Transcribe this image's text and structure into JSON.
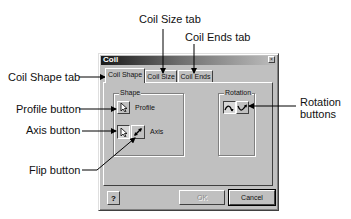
{
  "dialog": {
    "title": "Coil",
    "close_glyph": "×",
    "tabs": [
      {
        "label": "Coil Shape",
        "active": true
      },
      {
        "label": "Coil Size",
        "active": false
      },
      {
        "label": "Coil Ends",
        "active": false
      }
    ],
    "shape_group": {
      "label": "Shape",
      "profile_label": "Profile",
      "axis_label": "Axis",
      "profile_icon": "cursor-arrow-icon",
      "axis_icon": "cursor-arrow-icon",
      "flip_icon": "flip-diagonal-arrow-icon"
    },
    "rotation_group": {
      "label": "Rotation",
      "buttons": [
        {
          "icon": "clockwise-rotation-icon",
          "pressed": true
        },
        {
          "icon": "counterclockwise-rotation-icon",
          "pressed": false
        }
      ]
    },
    "help_glyph": "?",
    "ok_label": "OK",
    "ok_disabled": true,
    "cancel_label": "Cancel"
  },
  "callouts": {
    "coil_size_tab": "Coil Size tab",
    "coil_ends_tab": "Coil Ends tab",
    "coil_shape_tab": "Coil Shape tab",
    "profile_button": "Profile button",
    "axis_button": "Axis button",
    "flip_button": "Flip button",
    "rotation_buttons_line1": "Rotation",
    "rotation_buttons_line2": "buttons"
  }
}
